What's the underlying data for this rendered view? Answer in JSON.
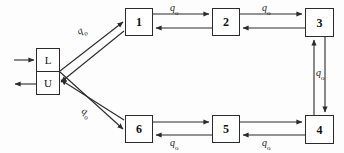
{
  "diagram": {
    "background_color": "#fdfdfd",
    "line_color": "#2b2b2b",
    "text_color": "#111111"
  },
  "interface": {
    "name": "LU",
    "upper_cell_label": "L",
    "lower_cell_label": "U",
    "input_arrow_name": "input-arrow-into-L",
    "output_arrow_name": "output-arrow-from-U"
  },
  "nodes": [
    {
      "id": "n1",
      "label": "1",
      "x": 125,
      "y": 8,
      "w": 28,
      "h": 28
    },
    {
      "id": "n2",
      "label": "2",
      "x": 212,
      "y": 8,
      "w": 28,
      "h": 28
    },
    {
      "id": "n3",
      "label": "3",
      "x": 305,
      "y": 8,
      "w": 29,
      "h": 29
    },
    {
      "id": "n4",
      "label": "4",
      "x": 305,
      "y": 115,
      "w": 29,
      "h": 29
    },
    {
      "id": "n5",
      "label": "5",
      "x": 212,
      "y": 115,
      "w": 28,
      "h": 28
    },
    {
      "id": "n6",
      "label": "6",
      "x": 125,
      "y": 115,
      "w": 28,
      "h": 28
    }
  ],
  "edge_labels": [
    {
      "id": "e_lu_1",
      "text": "q",
      "sub": "o",
      "x": 78,
      "y": 26,
      "rotated": "up"
    },
    {
      "id": "e_1_2",
      "text": "q",
      "sub": "o",
      "x": 170,
      "y": 2,
      "rotated": "none"
    },
    {
      "id": "e_2_3",
      "text": "q",
      "sub": "o",
      "x": 262,
      "y": 2,
      "rotated": "none"
    },
    {
      "id": "e_3_4",
      "text": "q",
      "sub": "o",
      "x": 316,
      "y": 67,
      "rotated": "none"
    },
    {
      "id": "e_4_5",
      "text": "q",
      "sub": "o",
      "x": 262,
      "y": 137,
      "rotated": "none"
    },
    {
      "id": "e_5_6",
      "text": "q",
      "sub": "o",
      "x": 170,
      "y": 137,
      "rotated": "none"
    },
    {
      "id": "e_lu_6",
      "text": "q",
      "sub": "o",
      "x": 82,
      "y": 104,
      "rotated": "none"
    }
  ],
  "edges": [
    {
      "from": "L",
      "to": "1",
      "direction": "forward",
      "name": "edge-L-to-1"
    },
    {
      "from": "1",
      "to": "U",
      "direction": "forward",
      "name": "edge-1-to-U"
    },
    {
      "from": "1",
      "to": "2",
      "direction": "both",
      "name": "edge-1-2"
    },
    {
      "from": "2",
      "to": "3",
      "direction": "both",
      "name": "edge-2-3"
    },
    {
      "from": "3",
      "to": "4",
      "direction": "both",
      "name": "edge-3-4"
    },
    {
      "from": "4",
      "to": "5",
      "direction": "both",
      "name": "edge-4-5"
    },
    {
      "from": "5",
      "to": "6",
      "direction": "both",
      "name": "edge-5-6"
    },
    {
      "from": "L",
      "to": "6",
      "direction": "forward",
      "name": "edge-L-to-6"
    },
    {
      "from": "6",
      "to": "U",
      "direction": "forward",
      "name": "edge-6-to-U"
    }
  ]
}
